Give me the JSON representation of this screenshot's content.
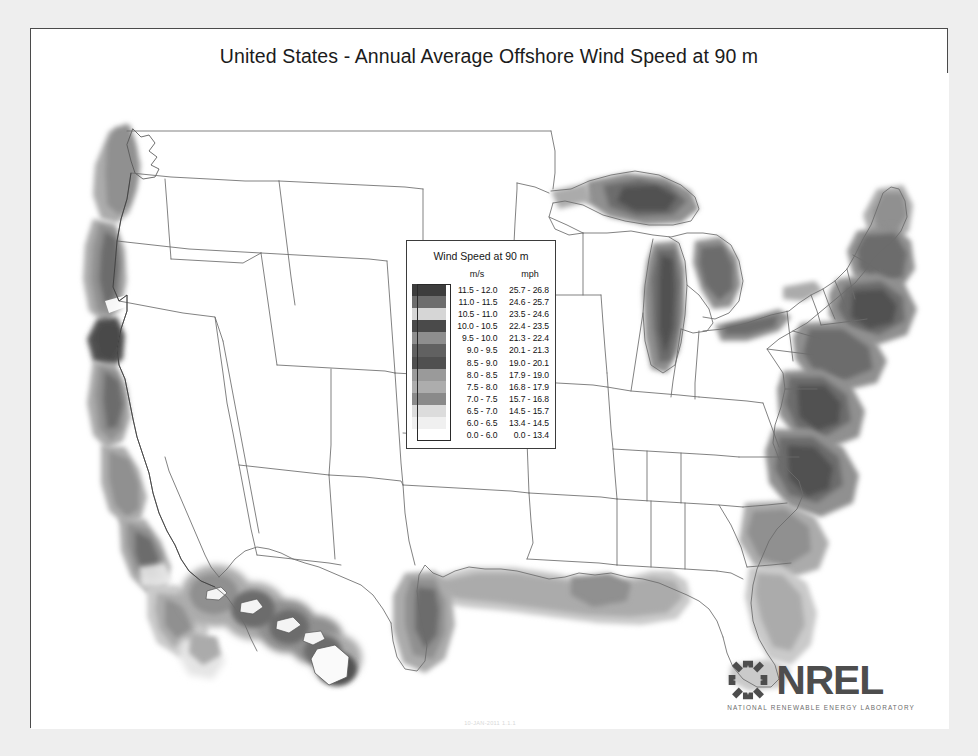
{
  "page": {
    "title": "United States - Annual Average Offshore Wind Speed at 90 m",
    "stamp": "10-JAN-2011 1.1.1"
  },
  "legend": {
    "title": "Wind Speed at 90 m",
    "col_swatch_header": "",
    "col_ms_header": "m/s",
    "col_mph_header": "mph",
    "rows": [
      {
        "ms": "11.5 - 12.0",
        "mph": "25.7 - 26.8",
        "color": "#3d3d3d"
      },
      {
        "ms": "11.0 - 11.5",
        "mph": "24.6 - 25.7",
        "color": "#6d6d6d"
      },
      {
        "ms": "10.5 - 11.0",
        "mph": "23.5 - 24.6",
        "color": "#d6d6d6"
      },
      {
        "ms": "10.0 - 10.5",
        "mph": "22.4 - 23.5",
        "color": "#4a4a4a"
      },
      {
        "ms": " 9.5 - 10.0",
        "mph": "21.3 - 22.4",
        "color": "#8e8e8e"
      },
      {
        "ms": " 9.0 -  9.5",
        "mph": "20.1 - 21.3",
        "color": "#616161"
      },
      {
        "ms": " 8.5 -  9.0",
        "mph": "19.0 - 20.1",
        "color": "#505050"
      },
      {
        "ms": " 8.0 -  8.5",
        "mph": "17.9 - 19.0",
        "color": "#9a9a9a"
      },
      {
        "ms": " 7.5 -  8.0",
        "mph": "16.8 - 17.9",
        "color": "#adadad"
      },
      {
        "ms": " 7.0 -  7.5",
        "mph": "15.7 - 16.8",
        "color": "#8a8a8a"
      },
      {
        "ms": " 6.5 -  7.0",
        "mph": "14.5 - 15.7",
        "color": "#dcdcdc"
      },
      {
        "ms": " 6.0 -  6.5",
        "mph": "13.4 - 14.5",
        "color": "#f0f0f0"
      },
      {
        "ms": " 0.0 -  6.0",
        "mph": " 0.0 - 13.4",
        "color": "#ffffff"
      }
    ]
  },
  "logo": {
    "wordmark": "NREL",
    "tagline": "NATIONAL RENEWABLE ENERGY LABORATORY",
    "mark_color": "#4d4d4d"
  },
  "chart_data": {
    "type": "map",
    "title": "United States - Annual Average Offshore Wind Speed at 90 m",
    "region": "Contiguous United States, Great Lakes, Hawaii inset",
    "units_primary": "m/s",
    "units_secondary": "mph",
    "value_min_ms": 0.0,
    "value_max_ms": 12.0,
    "value_min_mph": 0.0,
    "value_max_mph": 26.8,
    "class_breaks_ms": [
      0.0,
      6.0,
      6.5,
      7.0,
      7.5,
      8.0,
      8.5,
      9.0,
      9.5,
      10.0,
      10.5,
      11.0,
      11.5,
      12.0
    ],
    "class_breaks_mph": [
      0.0,
      13.4,
      14.5,
      15.7,
      16.8,
      17.9,
      19.0,
      20.1,
      21.3,
      22.4,
      23.5,
      24.6,
      25.7,
      26.8
    ],
    "colormap": "grayscale-halftone",
    "legend_position": "center",
    "grid": false,
    "annotations": [
      "NREL logo bottom right",
      "date stamp bottom center"
    ],
    "regions_with_resource": [
      {
        "name": "Pacific Coast",
        "speed_range_ms": "7.0 - 10.5"
      },
      {
        "name": "Atlantic Coast",
        "speed_range_ms": "7.5 - 10.0"
      },
      {
        "name": "Gulf of Mexico",
        "speed_range_ms": "6.0 - 8.5"
      },
      {
        "name": "Great Lakes",
        "speed_range_ms": "7.0 - 9.5"
      },
      {
        "name": "Hawaii",
        "speed_range_ms": "6.5 - 11.5"
      }
    ]
  }
}
